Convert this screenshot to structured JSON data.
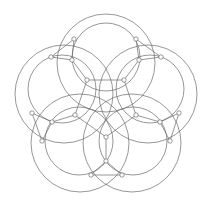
{
  "diagram": {
    "title": "",
    "width": 209,
    "height": 203,
    "stroke_color": "#6a6a6a",
    "node_fill": "#ffffff",
    "node_radius": 2.2,
    "circles": [
      {
        "id": "c-top",
        "cx": 106,
        "cy": 57,
        "r": 34
      },
      {
        "id": "c-right",
        "cx": 150,
        "cy": 89,
        "r": 34
      },
      {
        "id": "c-bottom-right",
        "cx": 133,
        "cy": 141,
        "r": 34
      },
      {
        "id": "c-bottom-left",
        "cx": 79,
        "cy": 141,
        "r": 34
      },
      {
        "id": "c-left",
        "cx": 62,
        "cy": 89,
        "r": 34
      },
      {
        "id": "o-top",
        "cx": 106,
        "cy": 63,
        "r": 49
      },
      {
        "id": "o-right",
        "cx": 148,
        "cy": 94,
        "r": 49
      },
      {
        "id": "o-bottom-right",
        "cx": 132,
        "cy": 143,
        "r": 49
      },
      {
        "id": "o-bottom-left",
        "cx": 80,
        "cy": 143,
        "r": 49
      },
      {
        "id": "o-left",
        "cx": 64,
        "cy": 94,
        "r": 49
      }
    ],
    "nodes": [
      {
        "id": "p1",
        "x": 87,
        "y": 80
      },
      {
        "id": "p2",
        "x": 124,
        "y": 80
      },
      {
        "id": "p3",
        "x": 136,
        "y": 115
      },
      {
        "id": "p4",
        "x": 106,
        "y": 137
      },
      {
        "id": "p5",
        "x": 75,
        "y": 115
      },
      {
        "id": "a1",
        "x": 72,
        "y": 60
      },
      {
        "id": "a2",
        "x": 139,
        "y": 60
      },
      {
        "id": "a3",
        "x": 160,
        "y": 122
      },
      {
        "id": "a4",
        "x": 106,
        "y": 161
      },
      {
        "id": "a5",
        "x": 52,
        "y": 122
      },
      {
        "id": "b1",
        "x": 74,
        "y": 39
      },
      {
        "id": "b2",
        "x": 136,
        "y": 39
      },
      {
        "id": "b3",
        "x": 161,
        "y": 57
      },
      {
        "id": "b4",
        "x": 179,
        "y": 113
      },
      {
        "id": "b5",
        "x": 170,
        "y": 141
      },
      {
        "id": "b6",
        "x": 122,
        "y": 175
      },
      {
        "id": "b7",
        "x": 91,
        "y": 175
      },
      {
        "id": "b8",
        "x": 42,
        "y": 141
      },
      {
        "id": "b9",
        "x": 32,
        "y": 113
      },
      {
        "id": "b10",
        "x": 51,
        "y": 57
      }
    ],
    "edges": [
      [
        "p1",
        "p2"
      ],
      [
        "p2",
        "p3"
      ],
      [
        "p3",
        "p4"
      ],
      [
        "p4",
        "p5"
      ],
      [
        "p5",
        "p1"
      ],
      [
        "p1",
        "a1"
      ],
      [
        "p2",
        "a2"
      ],
      [
        "p3",
        "a3"
      ],
      [
        "p4",
        "a4"
      ],
      [
        "p5",
        "a5"
      ],
      [
        "a1",
        "b1"
      ],
      [
        "a1",
        "b10"
      ],
      [
        "a2",
        "b2"
      ],
      [
        "a2",
        "b3"
      ],
      [
        "a3",
        "b4"
      ],
      [
        "a3",
        "b5"
      ],
      [
        "a4",
        "b6"
      ],
      [
        "a4",
        "b7"
      ],
      [
        "a5",
        "b8"
      ],
      [
        "a5",
        "b9"
      ],
      [
        "b1",
        "b10"
      ],
      [
        "b2",
        "b3"
      ],
      [
        "b4",
        "b5"
      ],
      [
        "b6",
        "b7"
      ],
      [
        "b8",
        "b9"
      ]
    ]
  }
}
